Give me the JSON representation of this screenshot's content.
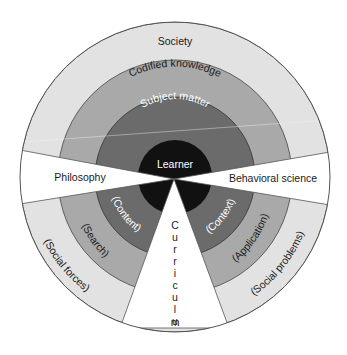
{
  "diagram": {
    "colors": {
      "background": "#ffffff",
      "society_ring": "#e2e2e2",
      "codified_ring": "#a9a9a9",
      "subject_ring": "#6b6b6b",
      "learner_core": "#111111",
      "wedge": "#ffffff",
      "outline": "#555555"
    },
    "rings": {
      "outer": "Society",
      "second": "Codified knowledge",
      "third": "Subject matter",
      "core": "Learner"
    },
    "wedges": {
      "left": "Philosophy",
      "right": "Behavioral science",
      "bottom": "Curriculum",
      "bottom_letters": [
        "C",
        "u",
        "r",
        "r",
        "i",
        "c",
        "u",
        "l",
        "u",
        "m"
      ]
    },
    "lower_left": {
      "outer": "(Social forces)",
      "second": "(Search)",
      "third": "(Content)"
    },
    "lower_right": {
      "outer": "(Social problems)",
      "second": "(Application)",
      "third": "(Context)"
    }
  }
}
